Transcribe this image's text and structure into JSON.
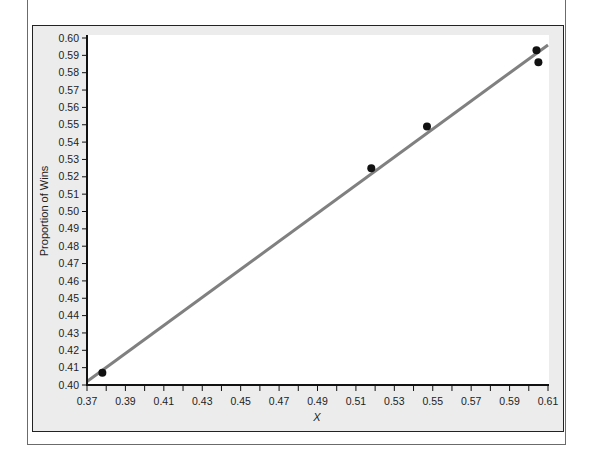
{
  "chart_data": {
    "type": "scatter",
    "title": "",
    "xlabel": "X",
    "ylabel": "Proportion of Wins",
    "xlim": [
      0.37,
      0.61
    ],
    "ylim": [
      0.4,
      0.6
    ],
    "x_ticks": [
      "0.37",
      "0.39",
      "0.41",
      "0.43",
      "0.45",
      "0.47",
      "0.49",
      "0.51",
      "0.53",
      "0.55",
      "0.57",
      "0.59",
      "0.61"
    ],
    "y_ticks": [
      "0.40",
      "0.41",
      "0.42",
      "0.43",
      "0.44",
      "0.45",
      "0.46",
      "0.47",
      "0.48",
      "0.49",
      "0.50",
      "0.51",
      "0.52",
      "0.53",
      "0.54",
      "0.55",
      "0.56",
      "0.57",
      "0.58",
      "0.59",
      "0.60"
    ],
    "grid": false,
    "legend": null,
    "series": [
      {
        "name": "Observed",
        "kind": "points",
        "color": "#111111",
        "points": [
          {
            "x": 0.378,
            "y": 0.407
          },
          {
            "x": 0.518,
            "y": 0.525
          },
          {
            "x": 0.547,
            "y": 0.549
          },
          {
            "x": 0.604,
            "y": 0.593
          },
          {
            "x": 0.605,
            "y": 0.586
          }
        ]
      },
      {
        "name": "Fitted line",
        "kind": "line",
        "color": "#808080",
        "points": [
          {
            "x": 0.37,
            "y": 0.402
          },
          {
            "x": 0.61,
            "y": 0.596
          }
        ]
      }
    ]
  }
}
